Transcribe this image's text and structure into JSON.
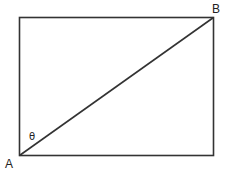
{
  "diagram": {
    "type": "rectangle-with-diagonal",
    "stroke_color": "#333333",
    "background": "#ffffff",
    "rectangle": {
      "x": 19,
      "y": 17,
      "width": 194,
      "height": 138
    },
    "diagonal": {
      "from": "A",
      "to": "B"
    },
    "labels": {
      "corner_a": "A",
      "corner_b": "B",
      "angle": "θ"
    }
  }
}
